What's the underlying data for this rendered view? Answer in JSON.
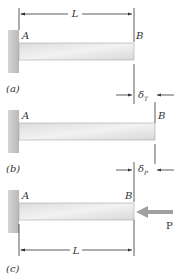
{
  "figure": {
    "panels": [
      {
        "id": "a",
        "caption": "(a)",
        "end_left": "A",
        "end_right": "B",
        "dimension": "L"
      },
      {
        "id": "b",
        "caption": "(b)",
        "end_left": "A",
        "end_right": "B",
        "delta_top_symbol": "δ",
        "delta_top_sub": "T",
        "delta_bottom_symbol": "δ",
        "delta_bottom_sub": "P"
      },
      {
        "id": "c",
        "caption": "(c)",
        "end_left": "A",
        "end_right": "B",
        "load": "P",
        "dimension": "L"
      }
    ],
    "colors": {
      "wall": "#c8c8c8",
      "beam": "#e4e4e4",
      "line": "#333333",
      "arrow_fill": "#a0a0a0"
    }
  }
}
